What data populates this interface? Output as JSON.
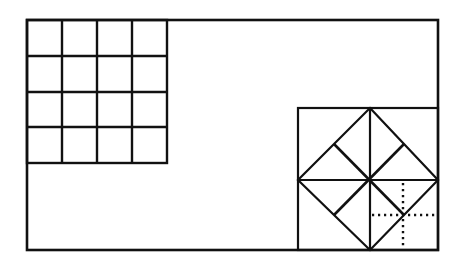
{
  "diagram": {
    "colors": {
      "stroke": "#111111",
      "background": "#ffffff"
    },
    "outer_rect": {
      "x": 27,
      "y": 20,
      "w": 411,
      "h": 230
    },
    "grid": {
      "x": 27,
      "y": 20,
      "cell": 35,
      "rows": 4,
      "cols": 4
    },
    "right_square": {
      "x": 298,
      "y": 108,
      "w": 140,
      "h": 142
    },
    "diamond": {
      "top": [
        370,
        108
      ],
      "right": [
        438,
        180
      ],
      "bottom": [
        370,
        250
      ],
      "left": [
        298,
        180
      ],
      "center": [
        370,
        180
      ]
    },
    "dotted_cross": {
      "cx": 403,
      "cy": 215,
      "x1": 372,
      "x2": 436,
      "y1": 182,
      "y2": 248
    }
  }
}
